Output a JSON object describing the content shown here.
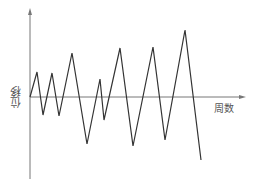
{
  "diagram": {
    "title": "",
    "y_axis_label": "位移",
    "x_axis_label": "周数",
    "colors": {
      "axis": "#777777",
      "curve": "#333333",
      "label": "#555555"
    }
  },
  "chart_data": {
    "type": "line",
    "title": "",
    "xlabel": "周数",
    "ylabel": "位移",
    "grid": false,
    "points_px": [
      [
        30,
        97
      ],
      [
        37,
        72
      ],
      [
        43,
        115
      ],
      [
        52,
        73
      ],
      [
        59,
        116
      ],
      [
        72,
        53
      ],
      [
        87,
        144
      ],
      [
        100,
        79
      ],
      [
        104,
        120
      ],
      [
        120,
        48
      ],
      [
        133,
        146
      ],
      [
        153,
        47
      ],
      [
        165,
        140
      ],
      [
        185,
        30
      ],
      [
        201,
        160
      ]
    ],
    "relative_values": [
      0,
      25,
      -18,
      24,
      -19,
      44,
      -47,
      18,
      -23,
      49,
      -49,
      50,
      -43,
      67,
      -63
    ]
  }
}
